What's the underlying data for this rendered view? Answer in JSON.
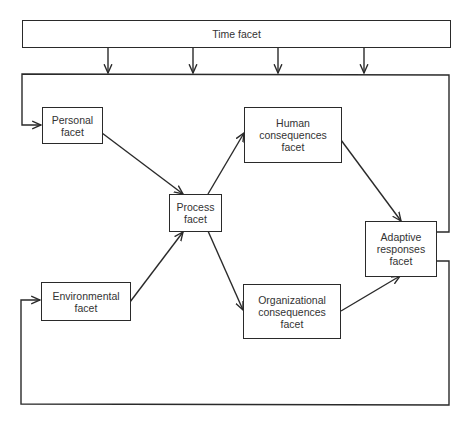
{
  "diagram": {
    "title": "",
    "nodes": [
      {
        "id": "time",
        "label": "Time facet"
      },
      {
        "id": "personal",
        "label": "Personal\nfacet"
      },
      {
        "id": "environmental",
        "label": "Environmental\nfacet"
      },
      {
        "id": "process",
        "label": "Process\nfacet"
      },
      {
        "id": "human",
        "label": "Human\nconsequences\nfacet"
      },
      {
        "id": "organizational",
        "label": "Organizational\nconsequences\nfacet"
      },
      {
        "id": "adaptive",
        "label": "Adaptive\nresponses\nfacet"
      }
    ],
    "edges": [
      {
        "from": "time",
        "to": "feedback-loop",
        "count": 4
      },
      {
        "from": "personal",
        "to": "process"
      },
      {
        "from": "environmental",
        "to": "process"
      },
      {
        "from": "process",
        "to": "human"
      },
      {
        "from": "process",
        "to": "organizational"
      },
      {
        "from": "human",
        "to": "adaptive"
      },
      {
        "from": "organizational",
        "to": "adaptive"
      },
      {
        "from": "adaptive",
        "to": "personal",
        "via": "top feedback loop"
      },
      {
        "from": "adaptive",
        "to": "environmental",
        "via": "bottom feedback loop"
      }
    ]
  },
  "colors": {
    "line": "#2a2a2a",
    "background": "#ffffff"
  }
}
